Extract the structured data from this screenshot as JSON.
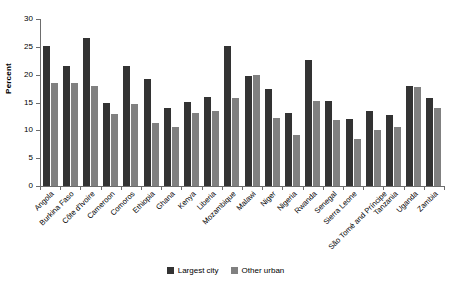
{
  "chart_data": {
    "type": "bar",
    "title": "",
    "subtitle": "",
    "xlabel": "",
    "ylabel": "Percent",
    "ylim": [
      0,
      30
    ],
    "yticks": [
      0,
      5,
      10,
      15,
      20,
      25,
      30
    ],
    "grid": false,
    "legend_position": "bottom-center",
    "categories": [
      "Angola",
      "Burkina Faso",
      "Côte d'Ivoire",
      "Cameroon",
      "Comoros",
      "Ethiopia",
      "Ghana",
      "Kenya",
      "Liberia",
      "Mozambique",
      "Malawi",
      "Niger",
      "Nigeria",
      "Rwanda",
      "Senegal",
      "Sierra Leone",
      "São Tomé and Príncipe",
      "Tanzania",
      "Uganda",
      "Zambia"
    ],
    "series": [
      {
        "name": "Largest city",
        "color": "#333333",
        "values": [
          25.1,
          21.6,
          26.5,
          15.0,
          21.5,
          19.3,
          14.1,
          15.1,
          16.0,
          25.2,
          19.8,
          17.4,
          13.1,
          22.7,
          15.3,
          12.0,
          13.5,
          12.8,
          17.9,
          15.8
        ]
      },
      {
        "name": "Other urban",
        "color": "#808080",
        "values": [
          18.5,
          18.5,
          18.0,
          13.0,
          14.7,
          11.3,
          10.6,
          13.1,
          13.5,
          15.8,
          19.9,
          12.2,
          9.2,
          15.3,
          11.8,
          8.4,
          10.1,
          10.6,
          17.7,
          14.1
        ]
      }
    ]
  },
  "axis": {
    "y_title": "Percent"
  },
  "legend": {
    "items": [
      {
        "label": "Largest city",
        "color": "#333333"
      },
      {
        "label": "Other urban",
        "color": "#808080"
      }
    ]
  }
}
